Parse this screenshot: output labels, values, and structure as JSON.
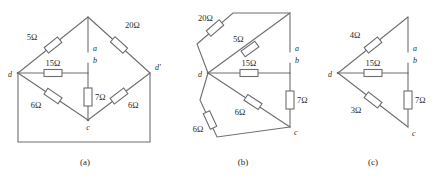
{
  "figure": {
    "background_color": "#ffffff",
    "line_color": "#6e6e6e",
    "text_color": "#2b2b2b"
  },
  "panels": [
    {
      "id": "a",
      "caption": "(a)",
      "terminals": [
        {
          "name": "a",
          "label": "a"
        },
        {
          "name": "b",
          "label": "b"
        },
        {
          "name": "c",
          "label": "c"
        },
        {
          "name": "d",
          "label": "d"
        },
        {
          "name": "d-prime",
          "label": "d'"
        }
      ],
      "resistors": [
        {
          "name": "r-5-ohm",
          "label": "5Ω",
          "value": 5,
          "unit": "Ω",
          "branch": "d-to-top"
        },
        {
          "name": "r-20-ohm",
          "label": "20Ω",
          "value": 20,
          "unit": "Ω",
          "branch": "top-to-d-prime"
        },
        {
          "name": "r-15-ohm",
          "label": "15Ω",
          "value": 15,
          "unit": "Ω",
          "branch": "d-to-b"
        },
        {
          "name": "r-7-ohm",
          "label": "7Ω",
          "value": 7,
          "unit": "Ω",
          "branch": "b-to-c"
        },
        {
          "name": "r-6-ohm-left",
          "label": "6Ω",
          "value": 6,
          "unit": "Ω",
          "branch": "d-to-c"
        },
        {
          "name": "r-6-ohm-right",
          "label": "6Ω",
          "value": 6,
          "unit": "Ω",
          "branch": "c-to-d-prime"
        }
      ]
    },
    {
      "id": "b",
      "caption": "(b)",
      "terminals": [
        {
          "name": "a",
          "label": "a"
        },
        {
          "name": "b",
          "label": "b"
        },
        {
          "name": "c",
          "label": "c"
        },
        {
          "name": "d",
          "label": "d"
        }
      ],
      "resistors": [
        {
          "name": "r-20-ohm",
          "label": "20Ω",
          "value": 20,
          "unit": "Ω",
          "branch": "d-to-a-outer"
        },
        {
          "name": "r-5-ohm",
          "label": "5Ω",
          "value": 5,
          "unit": "Ω",
          "branch": "d-to-a-inner"
        },
        {
          "name": "r-15-ohm",
          "label": "15Ω",
          "value": 15,
          "unit": "Ω",
          "branch": "d-to-b"
        },
        {
          "name": "r-7-ohm",
          "label": "7Ω",
          "value": 7,
          "unit": "Ω",
          "branch": "b-to-c"
        },
        {
          "name": "r-6-ohm-inner",
          "label": "6Ω",
          "value": 6,
          "unit": "Ω",
          "branch": "d-to-c-inner"
        },
        {
          "name": "r-6-ohm-outer",
          "label": "6Ω",
          "value": 6,
          "unit": "Ω",
          "branch": "d-to-c-outer"
        }
      ]
    },
    {
      "id": "c",
      "caption": "(c)",
      "terminals": [
        {
          "name": "a",
          "label": "a"
        },
        {
          "name": "b",
          "label": "b"
        },
        {
          "name": "c",
          "label": "c"
        },
        {
          "name": "d",
          "label": "d"
        }
      ],
      "resistors": [
        {
          "name": "r-4-ohm",
          "label": "4Ω",
          "value": 4,
          "unit": "Ω",
          "branch": "d-to-a"
        },
        {
          "name": "r-15-ohm",
          "label": "15Ω",
          "value": 15,
          "unit": "Ω",
          "branch": "d-to-b"
        },
        {
          "name": "r-3-ohm",
          "label": "3Ω",
          "value": 3,
          "unit": "Ω",
          "branch": "d-to-c"
        },
        {
          "name": "r-7-ohm",
          "label": "7Ω",
          "value": 7,
          "unit": "Ω",
          "branch": "b-to-c"
        }
      ]
    }
  ]
}
